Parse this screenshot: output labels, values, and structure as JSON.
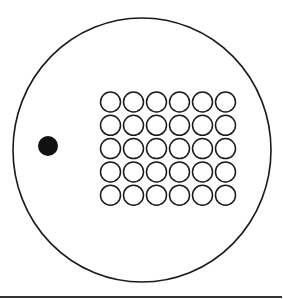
{
  "diagram": {
    "outer_circle": {
      "cx": 142,
      "cy": 150,
      "rx": 129,
      "ry": 132,
      "stroke": "#1a1a1a",
      "stroke_width": 1.6
    },
    "filled_dot": {
      "cx": 48,
      "cy": 146,
      "r": 10,
      "fill": "#111111"
    },
    "grid": {
      "rows": 5,
      "cols": 6,
      "origin_x": 110.5,
      "origin_y": 102,
      "pitch_x": 23,
      "pitch_y": 23.3,
      "circle_r": 10,
      "stroke": "#1a1a1a",
      "stroke_width": 1.5
    },
    "baseline": {
      "x1": 0,
      "x2": 282,
      "y": 297,
      "stroke": "#333333",
      "stroke_width": 2
    }
  }
}
